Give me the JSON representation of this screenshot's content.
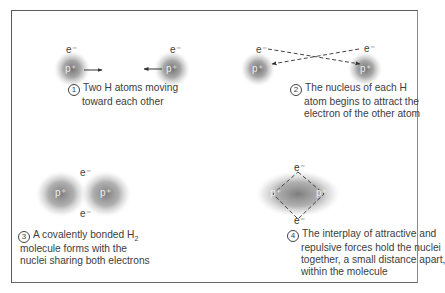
{
  "diagram": {
    "symbols": {
      "proton": "p⁺",
      "electron": "e⁻"
    },
    "colors": {
      "frame": "#5a5a5a",
      "nucleus_cloud": "#6f6f6f",
      "text": "#3d3d3d",
      "arrows": "#333333"
    },
    "panels": [
      {
        "number": "1",
        "caption_lines": [
          "Two H atoms moving",
          "toward each other"
        ],
        "atoms": [
          {
            "proton": "p⁺",
            "electron": "e⁻"
          },
          {
            "proton": "p⁺",
            "electron": "e⁻"
          }
        ],
        "arrows": "solid, pointing toward each other"
      },
      {
        "number": "2",
        "caption_lines": [
          "The nucleus of each H",
          "atom begins to attract the",
          "electron of the other atom"
        ],
        "atoms": [
          {
            "proton": "p⁺",
            "electron": "e⁻"
          },
          {
            "proton": "p⁺",
            "electron": "e⁻"
          }
        ],
        "arrows": "dashed, crossing from each electron to opposite nucleus"
      },
      {
        "number": "3",
        "caption_prefix": "A covalently bonded H",
        "caption_sub": "2",
        "caption_lines": [
          "molecule forms with the",
          "nuclei sharing both electrons"
        ],
        "atoms": [
          {
            "proton": "p⁺"
          },
          {
            "proton": "p⁺"
          }
        ],
        "shared_electrons": [
          "e⁻",
          "e⁻"
        ]
      },
      {
        "number": "4",
        "caption_lines": [
          "The interplay of attractive and",
          "repulsive forces hold the nuclei",
          "together, a small distance apart,",
          "within the molecule"
        ],
        "atoms": [
          {
            "proton": "p⁺"
          },
          {
            "proton": "p⁺"
          }
        ],
        "shared_electrons": [
          "e⁻",
          "e⁻"
        ],
        "arrows": "dashed diamond connecting electrons and nuclei"
      }
    ]
  }
}
